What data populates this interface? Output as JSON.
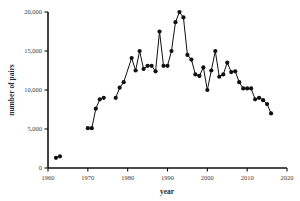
{
  "chart_data": {
    "type": "line",
    "title": "",
    "subtitle": "",
    "xlabel": "year",
    "ylabel": "number of pairs",
    "xlim": [
      1960,
      2020
    ],
    "ylim": [
      0,
      20000
    ],
    "xticks": [
      1960,
      1970,
      1980,
      1990,
      2000,
      2010,
      2020
    ],
    "xtick_labels": [
      "1960",
      "1970",
      "1980",
      "1990",
      "2000",
      "2010",
      "2020"
    ],
    "yticks": [
      0,
      5000,
      10000,
      15000,
      20000
    ],
    "ytick_labels": [
      "0",
      "5,000",
      "10,000",
      "15,000",
      "20,000"
    ],
    "grid": false,
    "legend": null,
    "legend_position": "none",
    "marker": "filled-circle",
    "line_color": "#111111",
    "marker_color": "#111111",
    "series": [
      {
        "name": "number of pairs",
        "x": [
          1962,
          1963,
          1970,
          1971,
          1972,
          1973,
          1974,
          1977,
          1978,
          1979,
          1981,
          1982,
          1983,
          1984,
          1985,
          1986,
          1987,
          1988,
          1989,
          1990,
          1991,
          1992,
          1993,
          1994,
          1995,
          1996,
          1997,
          1998,
          1999,
          2000,
          2001,
          2002,
          2003,
          2004,
          2005,
          2006,
          2007,
          2008,
          2009,
          2010,
          2011,
          2012,
          2013,
          2014,
          2015,
          2016
        ],
        "values": [
          1300,
          1500,
          5100,
          5100,
          7600,
          8800,
          9000,
          9000,
          10300,
          11000,
          14100,
          12500,
          15000,
          12700,
          13100,
          13100,
          12400,
          17500,
          13100,
          13100,
          15000,
          18700,
          20000,
          19300,
          14500,
          13900,
          12000,
          11800,
          12900,
          10000,
          12500,
          15000,
          11700,
          12000,
          13500,
          12300,
          12400,
          11000,
          10200,
          10200,
          10200,
          8800,
          9000,
          8700,
          8200,
          7000
        ]
      }
    ]
  },
  "axes": {
    "y_axis_label": "number of pairs",
    "x_axis_label": "year"
  }
}
